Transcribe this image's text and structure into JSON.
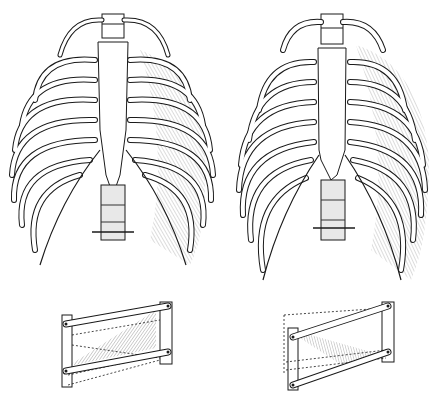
{
  "figure": {
    "background": "#ffffff",
    "ink": "#1a1a1a",
    "shade": "#9a9a9a",
    "panels": [
      {
        "id": "ribcage-left",
        "label": "",
        "description": "anterior view of thoracic cage, intercostal muscles shown on right side"
      },
      {
        "id": "ribcage-right",
        "label": "",
        "description": "anterior view of expanded thoracic cage, intercostal muscles shown on right side"
      },
      {
        "id": "model-left",
        "label": "",
        "description": "hinged parallel-bar model with fibers sloping downward, dashed alternate position below"
      },
      {
        "id": "model-right",
        "label": "",
        "description": "hinged parallel-bar model with fibers sloping upward, dashed alternate position above"
      }
    ]
  }
}
